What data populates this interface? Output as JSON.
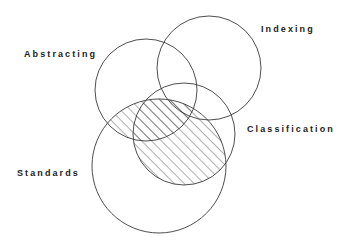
{
  "diagram": {
    "type": "venn",
    "sets": [
      {
        "id": "abstracting",
        "label": "Abstracting",
        "cx": 146,
        "cy": 90,
        "r": 51,
        "label_x": 24,
        "label_y": 49
      },
      {
        "id": "indexing",
        "label": "Indexing",
        "cx": 209,
        "cy": 68,
        "r": 52,
        "label_x": 261,
        "label_y": 24
      },
      {
        "id": "classification",
        "label": "Classification",
        "cx": 184,
        "cy": 134,
        "r": 51,
        "label_x": 247,
        "label_y": 124
      },
      {
        "id": "standards",
        "label": "Standards",
        "cx": 159,
        "cy": 166,
        "r": 67,
        "label_x": 17,
        "label_y": 168
      }
    ],
    "highlighted_region": {
      "description": "Standards ∩ (Abstracting ∪ Classification)",
      "fill_pattern": "diagonal-hatch",
      "color": "#3a3a3a"
    },
    "stroke_color": "#3a3a3a",
    "background": "#ffffff"
  }
}
